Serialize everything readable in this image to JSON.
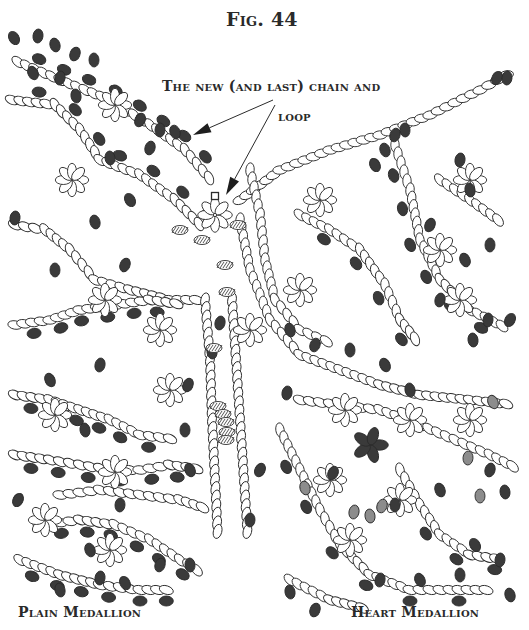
{
  "figure": {
    "title": "Fig. 44",
    "annotation_line1": "The new (and last) chain and",
    "annotation_line2": "loop",
    "caption_left": "Plain Medallion",
    "caption_right": "Heart Medallion"
  },
  "colors": {
    "background": "#ffffff",
    "outline": "#2b2b2b",
    "dark_bead": "#3a3a3a",
    "gray_bead": "#8c8c8c",
    "text": "#2a2a2a"
  },
  "chains": [
    {
      "pts": [
        [
          18,
          62
        ],
        [
          60,
          80
        ],
        [
          110,
          100
        ],
        [
          150,
          125
        ],
        [
          185,
          150
        ],
        [
          215,
          185
        ]
      ],
      "dark_every": 3,
      "side": -1
    },
    {
      "pts": [
        [
          12,
          100
        ],
        [
          55,
          105
        ],
        [
          80,
          130
        ],
        [
          100,
          160
        ],
        [
          140,
          175
        ],
        [
          175,
          200
        ],
        [
          205,
          230
        ]
      ],
      "dark_every": 4,
      "side": -1
    },
    {
      "pts": [
        [
          15,
          225
        ],
        [
          45,
          230
        ],
        [
          70,
          250
        ],
        [
          95,
          280
        ],
        [
          130,
          290
        ],
        [
          170,
          300
        ],
        [
          205,
          300
        ]
      ],
      "dark_every": 0,
      "side": 1
    },
    {
      "pts": [
        [
          240,
          200
        ],
        [
          280,
          170
        ],
        [
          330,
          150
        ],
        [
          380,
          135
        ],
        [
          430,
          115
        ],
        [
          480,
          90
        ],
        [
          515,
          70
        ]
      ],
      "dark_every": 0,
      "side": 1
    },
    {
      "pts": [
        [
          205,
          300
        ],
        [
          210,
          360
        ],
        [
          212,
          420
        ],
        [
          215,
          480
        ],
        [
          218,
          540
        ]
      ],
      "dark_every": 0,
      "side": 1
    },
    {
      "pts": [
        [
          232,
          300
        ],
        [
          236,
          360
        ],
        [
          240,
          420
        ],
        [
          244,
          480
        ],
        [
          248,
          540
        ]
      ],
      "dark_every": 0,
      "side": 1
    },
    {
      "pts": [
        [
          240,
          220
        ],
        [
          250,
          270
        ],
        [
          270,
          320
        ],
        [
          300,
          355
        ],
        [
          340,
          370
        ],
        [
          380,
          385
        ],
        [
          420,
          395
        ],
        [
          470,
          400
        ],
        [
          515,
          405
        ]
      ],
      "dark_every": 0,
      "side": 1
    },
    {
      "pts": [
        [
          395,
          145
        ],
        [
          410,
          190
        ],
        [
          420,
          240
        ],
        [
          440,
          280
        ],
        [
          470,
          310
        ],
        [
          510,
          330
        ]
      ],
      "dark_every": 4,
      "side": 1
    },
    {
      "pts": [
        [
          440,
          180
        ],
        [
          470,
          200
        ],
        [
          505,
          225
        ]
      ],
      "dark_every": 0,
      "side": 1
    },
    {
      "pts": [
        [
          15,
          325
        ],
        [
          50,
          320
        ],
        [
          80,
          310
        ],
        [
          115,
          305
        ],
        [
          150,
          300
        ],
        [
          185,
          305
        ]
      ],
      "dark_every": 3,
      "side": 1
    },
    {
      "pts": [
        [
          15,
          395
        ],
        [
          50,
          400
        ],
        [
          80,
          410
        ],
        [
          110,
          420
        ],
        [
          140,
          435
        ],
        [
          180,
          440
        ]
      ],
      "dark_every": 3,
      "side": 1
    },
    {
      "pts": [
        [
          15,
          455
        ],
        [
          50,
          460
        ],
        [
          80,
          465
        ],
        [
          110,
          470
        ],
        [
          140,
          470
        ],
        [
          170,
          465
        ],
        [
          205,
          470
        ]
      ],
      "dark_every": 3,
      "side": 1
    },
    {
      "pts": [
        [
          40,
          525
        ],
        [
          80,
          520
        ],
        [
          115,
          525
        ],
        [
          150,
          540
        ],
        [
          180,
          560
        ],
        [
          205,
          575
        ]
      ],
      "dark_every": 3,
      "side": 1
    },
    {
      "pts": [
        [
          20,
          560
        ],
        [
          60,
          575
        ],
        [
          100,
          585
        ],
        [
          140,
          590
        ],
        [
          175,
          590
        ]
      ],
      "dark_every": 3,
      "side": 1
    },
    {
      "pts": [
        [
          60,
          495
        ],
        [
          100,
          490
        ],
        [
          140,
          495
        ],
        [
          180,
          500
        ],
        [
          210,
          510
        ]
      ],
      "dark_every": 0,
      "side": 1
    },
    {
      "pts": [
        [
          280,
          430
        ],
        [
          300,
          470
        ],
        [
          320,
          510
        ],
        [
          340,
          545
        ],
        [
          370,
          575
        ],
        [
          410,
          590
        ],
        [
          450,
          590
        ],
        [
          495,
          590
        ]
      ],
      "dark_every": 5,
      "side": 1
    },
    {
      "pts": [
        [
          300,
          400
        ],
        [
          340,
          405
        ],
        [
          380,
          410
        ],
        [
          420,
          425
        ],
        [
          455,
          440
        ],
        [
          490,
          455
        ],
        [
          520,
          470
        ]
      ],
      "dark_every": 0,
      "side": 1
    },
    {
      "pts": [
        [
          400,
          470
        ],
        [
          420,
          505
        ],
        [
          440,
          535
        ],
        [
          470,
          555
        ],
        [
          505,
          560
        ]
      ],
      "dark_every": 4,
      "side": 1
    },
    {
      "pts": [
        [
          290,
          580
        ],
        [
          330,
          600
        ],
        [
          370,
          610
        ]
      ],
      "dark_every": 0,
      "side": 1
    },
    {
      "pts": [
        [
          250,
          170
        ],
        [
          260,
          215
        ],
        [
          265,
          260
        ],
        [
          275,
          300
        ],
        [
          300,
          330
        ],
        [
          335,
          345
        ]
      ],
      "dark_every": 0,
      "side": 1
    },
    {
      "pts": [
        [
          300,
          215
        ],
        [
          330,
          230
        ],
        [
          360,
          250
        ],
        [
          385,
          285
        ],
        [
          400,
          320
        ],
        [
          420,
          345
        ]
      ],
      "dark_every": 5,
      "side": 1
    }
  ],
  "rosettes": [
    {
      "cx": 215,
      "cy": 215,
      "r": 15,
      "n": 8,
      "dark": []
    },
    {
      "cx": 115,
      "cy": 105,
      "r": 14,
      "n": 8,
      "dark": []
    },
    {
      "cx": 72,
      "cy": 180,
      "r": 14,
      "n": 8,
      "dark": []
    },
    {
      "cx": 105,
      "cy": 300,
      "r": 14,
      "n": 8,
      "dark": []
    },
    {
      "cx": 160,
      "cy": 330,
      "r": 14,
      "n": 8,
      "dark": []
    },
    {
      "cx": 55,
      "cy": 415,
      "r": 14,
      "n": 8,
      "dark": []
    },
    {
      "cx": 115,
      "cy": 472,
      "r": 14,
      "n": 8,
      "dark": []
    },
    {
      "cx": 45,
      "cy": 520,
      "r": 14,
      "n": 8,
      "dark": []
    },
    {
      "cx": 110,
      "cy": 550,
      "r": 14,
      "n": 8,
      "dark": []
    },
    {
      "cx": 170,
      "cy": 390,
      "r": 14,
      "n": 8,
      "dark": []
    },
    {
      "cx": 300,
      "cy": 290,
      "r": 14,
      "n": 8,
      "dark": []
    },
    {
      "cx": 440,
      "cy": 250,
      "r": 14,
      "n": 8,
      "dark": []
    },
    {
      "cx": 470,
      "cy": 180,
      "r": 14,
      "n": 8,
      "dark": []
    },
    {
      "cx": 460,
      "cy": 300,
      "r": 14,
      "n": 8,
      "dark": []
    },
    {
      "cx": 370,
      "cy": 445,
      "r": 15,
      "n": 5,
      "dark": [
        0,
        1,
        2,
        3,
        4
      ]
    },
    {
      "cx": 345,
      "cy": 410,
      "r": 14,
      "n": 8,
      "dark": []
    },
    {
      "cx": 410,
      "cy": 420,
      "r": 14,
      "n": 8,
      "dark": []
    },
    {
      "cx": 330,
      "cy": 480,
      "r": 14,
      "n": 8,
      "dark": []
    },
    {
      "cx": 400,
      "cy": 500,
      "r": 14,
      "n": 8,
      "dark": []
    },
    {
      "cx": 470,
      "cy": 420,
      "r": 14,
      "n": 8,
      "dark": []
    },
    {
      "cx": 350,
      "cy": 540,
      "r": 14,
      "n": 8,
      "dark": []
    },
    {
      "cx": 250,
      "cy": 330,
      "r": 14,
      "n": 8,
      "dark": []
    },
    {
      "cx": 320,
      "cy": 200,
      "r": 14,
      "n": 8,
      "dark": []
    }
  ],
  "loose_dark": [
    [
      14,
      38
    ],
    [
      38,
      36
    ],
    [
      55,
      45
    ],
    [
      75,
      54
    ],
    [
      94,
      60
    ],
    [
      33,
      73
    ],
    [
      60,
      78
    ],
    [
      76,
      96
    ],
    [
      140,
      120
    ],
    [
      160,
      130
    ],
    [
      175,
      132
    ],
    [
      150,
      148
    ],
    [
      110,
      158
    ],
    [
      130,
      200
    ],
    [
      15,
      218
    ],
    [
      95,
      222
    ],
    [
      125,
      265
    ],
    [
      55,
      270
    ],
    [
      50,
      380
    ],
    [
      100,
      365
    ],
    [
      85,
      430
    ],
    [
      18,
      500
    ],
    [
      120,
      505
    ],
    [
      90,
      550
    ],
    [
      160,
      565
    ],
    [
      190,
      565
    ],
    [
      125,
      583
    ],
    [
      100,
      578
    ],
    [
      60,
      590
    ],
    [
      188,
      385
    ],
    [
      185,
      430
    ],
    [
      190,
      470
    ],
    [
      220,
      323
    ],
    [
      212,
      352
    ],
    [
      497,
      78
    ],
    [
      507,
      78
    ],
    [
      385,
      150
    ],
    [
      395,
      135
    ],
    [
      405,
      130
    ],
    [
      375,
      165
    ],
    [
      460,
      160
    ],
    [
      470,
      190
    ],
    [
      430,
      225
    ],
    [
      490,
      245
    ],
    [
      465,
      260
    ],
    [
      440,
      300
    ],
    [
      473,
      340
    ],
    [
      510,
      320
    ],
    [
      488,
      320
    ],
    [
      290,
      330
    ],
    [
      315,
      345
    ],
    [
      350,
      350
    ],
    [
      385,
      365
    ],
    [
      287,
      393
    ],
    [
      410,
      390
    ],
    [
      333,
      473
    ],
    [
      395,
      505
    ],
    [
      440,
      490
    ],
    [
      490,
      470
    ],
    [
      505,
      492
    ],
    [
      475,
      545
    ],
    [
      500,
      560
    ],
    [
      510,
      595
    ],
    [
      315,
      610
    ],
    [
      460,
      575
    ],
    [
      420,
      580
    ],
    [
      380,
      580
    ],
    [
      290,
      592
    ],
    [
      260,
      470
    ],
    [
      250,
      520
    ]
  ],
  "loose_gray": [
    [
      493,
      402
    ],
    [
      468,
      458
    ],
    [
      305,
      488
    ],
    [
      354,
      512
    ],
    [
      370,
      516
    ],
    [
      382,
      506
    ],
    [
      480,
      496
    ]
  ],
  "hatched": [
    [
      180,
      230
    ],
    [
      238,
      225
    ],
    [
      202,
      240
    ],
    [
      225,
      265
    ],
    [
      227,
      292
    ],
    [
      214,
      348
    ],
    [
      218,
      406
    ],
    [
      223,
      414
    ],
    [
      226,
      422
    ],
    [
      227,
      432
    ],
    [
      226,
      440
    ]
  ],
  "marker_square": [
    215,
    196
  ],
  "arrows": [
    {
      "from": [
        273,
        100
      ],
      "to": [
        193,
        135
      ]
    },
    {
      "from": [
        275,
        105
      ],
      "to": [
        226,
        195
      ]
    }
  ]
}
